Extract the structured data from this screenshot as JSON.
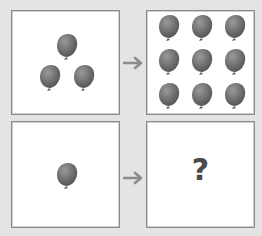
{
  "puzzle": {
    "rows": [
      {
        "input": {
          "balloon_count": 3,
          "label": ""
        },
        "output": {
          "balloon_count": 9,
          "label": ""
        }
      },
      {
        "input": {
          "balloon_count": 1,
          "label": ""
        },
        "output": {
          "balloon_count": null,
          "label": "?"
        }
      }
    ],
    "arrow_symbol": "→"
  },
  "colors": {
    "background": "#e4e4e4",
    "panel": "#ffffff",
    "panel_border": "#8a8a8a",
    "balloon": "#6e6e6e",
    "arrow": "#8c8c8c",
    "question_mark": "#4a4a4a"
  }
}
